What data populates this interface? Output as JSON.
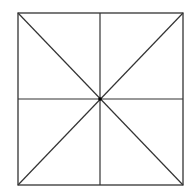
{
  "diagram": {
    "type": "square-with-diagonals-and-midlines",
    "stroke_color": "#333333",
    "center_dot_color": "#000000",
    "square": {
      "x1": 18,
      "y1": 13,
      "x2": 183,
      "y2": 185
    },
    "center": {
      "x": 100,
      "y": 99
    }
  }
}
